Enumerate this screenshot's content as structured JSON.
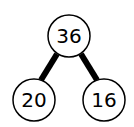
{
  "diagram": {
    "type": "number-bond",
    "root": {
      "label": "36"
    },
    "children": [
      {
        "label": "20"
      },
      {
        "label": "16"
      }
    ]
  }
}
